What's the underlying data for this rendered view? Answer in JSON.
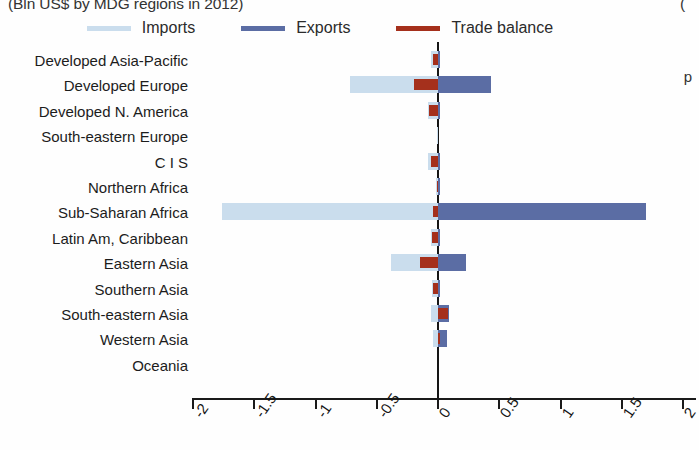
{
  "title": {
    "main": "(Bln US$ by MDG regions in 2012)",
    "right_fragment": "(",
    "side_fragment": "p"
  },
  "legend": {
    "position": "top",
    "items": [
      {
        "label": "Imports",
        "color": "#cadded",
        "name": "imports"
      },
      {
        "label": "Exports",
        "color": "#5b6da4",
        "name": "exports"
      },
      {
        "label": "Trade balance",
        "color": "#a5301c",
        "name": "trade-balance"
      }
    ]
  },
  "axis": {
    "xlabel": "",
    "ylabel": "",
    "xlim": [
      -2,
      2
    ],
    "ticks": [
      "-2",
      "-1.5",
      "-1",
      "-0.5",
      "0",
      "0.5",
      "1",
      "1.5",
      "2"
    ],
    "tick_values": [
      -2,
      -1.5,
      -1,
      -0.5,
      0,
      0.5,
      1,
      1.5,
      2
    ],
    "grid": false
  },
  "chart_data": {
    "type": "bar",
    "orientation": "horizontal",
    "title": "(Bln US$ by MDG regions in 2012)",
    "xlabel": "",
    "ylabel": "",
    "xlim": [
      -2,
      2
    ],
    "grid": false,
    "legend_position": "top",
    "categories": [
      "Developed Asia-Pacific",
      "Developed Europe",
      "Developed N. America",
      "South-eastern Europe",
      "C I S",
      "Northern Africa",
      "Sub-Saharan Africa",
      "Latin Am, Caribbean",
      "Eastern Asia",
      "Southern Asia",
      "South-eastern Asia",
      "Western Asia",
      "Oceania"
    ],
    "series": [
      {
        "name": "Imports",
        "color": "#cadded",
        "values": [
          -0.06,
          -0.72,
          -0.08,
          -0.01,
          -0.08,
          -0.02,
          -1.76,
          -0.06,
          -0.38,
          -0.05,
          -0.06,
          -0.04,
          0.0
        ]
      },
      {
        "name": "Exports",
        "color": "#5b6da4",
        "values": [
          0.02,
          0.43,
          0.01,
          0.0,
          0.02,
          0.01,
          1.7,
          0.01,
          0.23,
          0.01,
          0.09,
          0.07,
          0.0
        ]
      },
      {
        "name": "Trade balance",
        "color": "#a5301c",
        "values": [
          -0.04,
          -0.2,
          -0.07,
          0.0,
          -0.06,
          -0.01,
          -0.04,
          -0.05,
          -0.15,
          -0.04,
          0.08,
          0.01,
          0.0
        ]
      }
    ]
  }
}
